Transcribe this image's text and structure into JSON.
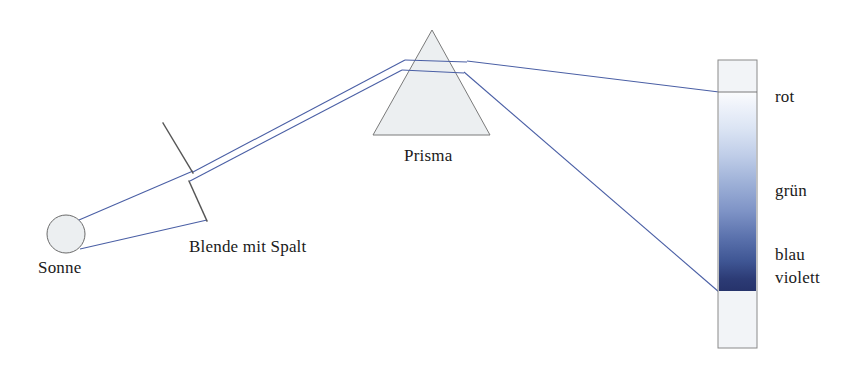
{
  "figure": {
    "background_color": "#ffffff",
    "width": 855,
    "height": 368
  },
  "colors": {
    "ray": "#4a5fa5",
    "ray_stroke": "#4c5fa8",
    "outline": "#6b6b6b",
    "blade": "#555555",
    "body_fill": "#eceff1",
    "spectrum_white": "#fbfcfd",
    "spectrum_light": "#dfe6f2",
    "spectrum_mid": "#7f96c4",
    "spectrum_deep": "#3f5694",
    "spectrum_dark": "#26336b",
    "label_text": "#1a1a1a"
  },
  "labels": {
    "sonne": "Sonne",
    "blende": "Blende mit Spalt",
    "prisma": "Prisma",
    "rot": "rot",
    "gruen": "grün",
    "blau": "blau",
    "violett": "violett"
  },
  "elements": {
    "sun": {
      "cx": 66,
      "cy": 234,
      "r": 19
    },
    "aperture": {
      "upper_blade": {
        "x1": 163,
        "y1": 123,
        "x2": 192,
        "y2": 172
      },
      "lower_blade": {
        "x1": 189,
        "y1": 181,
        "x2": 206,
        "y2": 220
      },
      "slit_gap_y": 176
    },
    "prism": {
      "apex_x": 432,
      "apex_y": 30,
      "base_left_x": 373,
      "base_right_x": 490,
      "base_y": 135
    },
    "screen": {
      "x": 718,
      "y": 60,
      "width": 39,
      "height": 288
    },
    "spectrum_band": {
      "top_y": 92,
      "bottom_y": 291
    }
  },
  "rays": {
    "sun_to_slit_upper": {
      "x1": 80,
      "y1": 220,
      "x2": 192,
      "y2": 172
    },
    "sun_to_slit_lower": {
      "x1": 80,
      "y1": 248,
      "x2": 206,
      "y2": 220
    },
    "beam_to_prism_top": {
      "x1": 192,
      "y1": 172,
      "x2": 404,
      "y2": 60
    },
    "beam_to_prism_bottom": {
      "x1": 189,
      "y1": 181,
      "x2": 400,
      "y2": 70
    },
    "internal_top": {
      "x1": 404,
      "y1": 60,
      "x2": 466,
      "y2": 62
    },
    "internal_bottom": {
      "x1": 400,
      "y1": 70,
      "x2": 463,
      "y2": 72
    },
    "dispersed_red": {
      "x1": 466,
      "y1": 62,
      "x2": 718,
      "y2": 92
    },
    "dispersed_violet": {
      "x1": 463,
      "y1": 72,
      "x2": 718,
      "y2": 291
    }
  },
  "spectrum_stops": [
    {
      "offset": 0,
      "color": "#fbfcfd",
      "name": "white-edge"
    },
    {
      "offset": 0.1,
      "color": "#e8eef8",
      "name": "rot-zone"
    },
    {
      "offset": 0.3,
      "color": "#c2cfe8",
      "name": "gelb-gruen-zone"
    },
    {
      "offset": 0.52,
      "color": "#8fa3cc",
      "name": "gruen-zone"
    },
    {
      "offset": 0.74,
      "color": "#566da8",
      "name": "blau-zone"
    },
    {
      "offset": 0.9,
      "color": "#32417d",
      "name": "violett-zone"
    },
    {
      "offset": 1,
      "color": "#26336b",
      "name": "violett-edge"
    }
  ]
}
